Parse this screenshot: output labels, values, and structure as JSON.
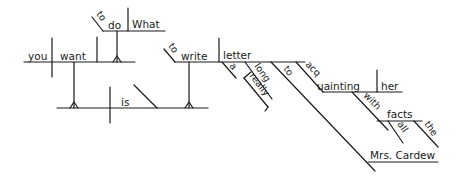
{
  "diagram": {
    "type": "sentence-diagram",
    "sentence_words": {
      "you": "you",
      "want": "want",
      "to1": "to",
      "do": "do",
      "what": "What",
      "is": "is",
      "to2": "to",
      "write": "write",
      "letter": "letter",
      "a": "a",
      "long": "long",
      "really": "really",
      "to3": "to",
      "acquainting": "acquainting",
      "her": "her",
      "with": "with",
      "facts": "facts",
      "all": "all",
      "the": "the",
      "mrs_cardew": "Mrs. Cardew"
    }
  }
}
